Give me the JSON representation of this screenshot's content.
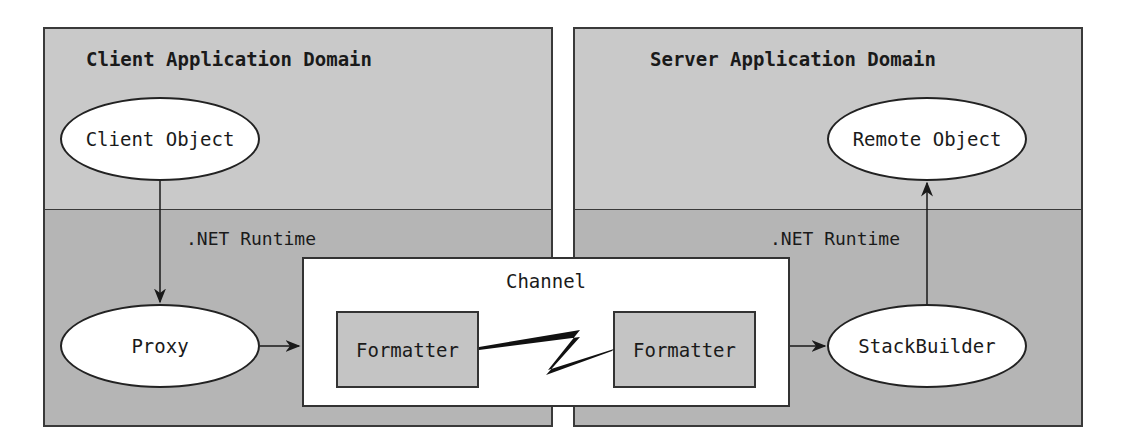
{
  "client_domain": {
    "title": "Client Application Domain",
    "runtime_label": ".NET Runtime",
    "client_object": "Client Object",
    "proxy": "Proxy"
  },
  "server_domain": {
    "title": "Server Application Domain",
    "runtime_label": ".NET Runtime",
    "remote_object": "Remote Object",
    "stack_builder": "StackBuilder"
  },
  "channel": {
    "title": "Channel",
    "left_formatter": "Formatter",
    "right_formatter": "Formatter"
  },
  "colors": {
    "upper_region": "#c9c9c9",
    "lower_region": "#b5b5b5",
    "border": "#333333"
  }
}
